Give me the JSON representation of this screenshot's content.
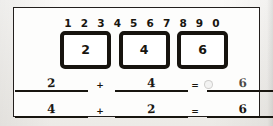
{
  "worksheet": {
    "title": "Addition practice worksheet",
    "ink_color": "#18150f",
    "paper_color": "#fdfdfc",
    "digit_strip": {
      "name": "number-strip",
      "digits": [
        "1",
        "2",
        "3",
        "4",
        "5",
        "6",
        "7",
        "8",
        "9",
        "0"
      ]
    },
    "boxes": [
      {
        "value": "2"
      },
      {
        "value": "4"
      },
      {
        "value": "6"
      }
    ],
    "equations": [
      {
        "left": "2",
        "operator": "+",
        "right": "4",
        "equals": "=",
        "result": "6",
        "result_faint": true
      },
      {
        "left": "4",
        "operator": "+",
        "right": "2",
        "equals": "=",
        "result": "6",
        "result_faint": false
      }
    ]
  }
}
